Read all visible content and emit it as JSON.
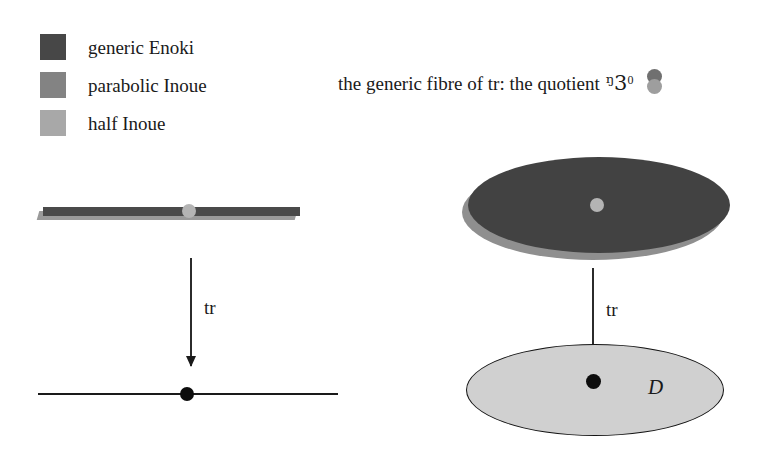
{
  "figure": {
    "background_color": "#ffffff",
    "legend": {
      "items": [
        {
          "label": "generic Enoki",
          "color": "#474747",
          "swatch_name": "swatch-generic-enoki"
        },
        {
          "label": "parabolic Inoue",
          "color": "#838383",
          "swatch_name": "swatch-parabolic-inoue"
        },
        {
          "label": "half Inoue",
          "color": "#a8a8a8",
          "swatch_name": "swatch-half-inoue"
        }
      ]
    },
    "caption": {
      "text": "the generic fibre of tr: the quotient",
      "symbol": "ℙ",
      "symbol_fraktur": "ᵑ3",
      "superscript": "0",
      "icon_name": "two-stacked-circles-icon",
      "icon_top_color": "#707070",
      "icon_bottom_color": "#9e9e9e"
    },
    "left_panel": {
      "bar": {
        "top_color": "#4a4a4a",
        "shadow_color": "#9a9a9a",
        "node_color": "#b4b4b4",
        "node_name": "bar-center-node"
      },
      "arrow": {
        "label": "tr"
      },
      "axis": {
        "line_color": "#1a1a1a",
        "dot_color": "#0d0d0d"
      }
    },
    "right_panel": {
      "top_ellipse": {
        "fill_color": "#424242",
        "shadow_color": "#8f8f8f",
        "node_color": "#b4b4b4"
      },
      "arrow": {
        "label": "tr"
      },
      "bottom_ellipse": {
        "fill_color": "#d0d0d0",
        "stroke_color": "#141414",
        "dot_color": "#0d0d0d",
        "label": "D"
      }
    }
  }
}
